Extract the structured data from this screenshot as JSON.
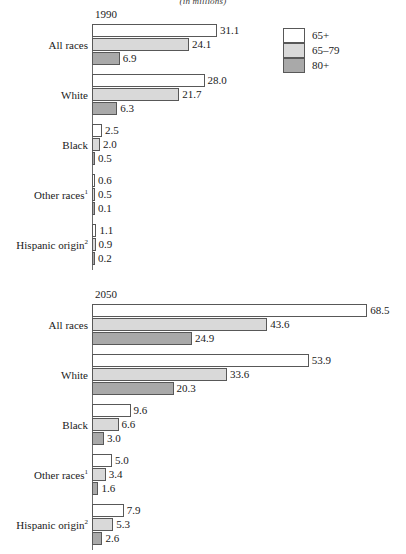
{
  "chart_data": {
    "type": "bar",
    "orientation": "horizontal",
    "title": "",
    "subtitle": "(in millions)",
    "xlabel": "",
    "ylabel": "",
    "grid": false,
    "legend_position": "top-right",
    "xlim": [
      0,
      68.5
    ],
    "categories": [
      "All races",
      "White",
      "Black",
      "Other races",
      "Hispanic origin"
    ],
    "category_footnotes": [
      "",
      "",
      "",
      "1",
      "2"
    ],
    "series": [
      {
        "name": "65+",
        "color": "#ffffff"
      },
      {
        "name": "65–79",
        "color": "#d9d9d9"
      },
      {
        "name": "80+",
        "color": "#a9a9a9"
      }
    ],
    "panels": [
      {
        "label": "1990",
        "groups": [
          {
            "category": "All races",
            "footnote": "",
            "values": [
              31.1,
              24.1,
              6.9
            ],
            "labels": [
              "31.1",
              "24.1",
              "6.9"
            ]
          },
          {
            "category": "White",
            "footnote": "",
            "values": [
              28.0,
              21.7,
              6.3
            ],
            "labels": [
              "28.0",
              "21.7",
              "6.3"
            ]
          },
          {
            "category": "Black",
            "footnote": "",
            "values": [
              2.5,
              2.0,
              0.5
            ],
            "labels": [
              "2.5",
              "2.0",
              "0.5"
            ]
          },
          {
            "category": "Other races",
            "footnote": "1",
            "values": [
              0.6,
              0.5,
              0.1
            ],
            "labels": [
              "0.6",
              "0.5",
              "0.1"
            ]
          },
          {
            "category": "Hispanic origin",
            "footnote": "2",
            "values": [
              1.1,
              0.9,
              0.2
            ],
            "labels": [
              "1.1",
              "0.9",
              "0.2"
            ]
          }
        ]
      },
      {
        "label": "2050",
        "groups": [
          {
            "category": "All races",
            "footnote": "",
            "values": [
              68.5,
              43.6,
              24.9
            ],
            "labels": [
              "68.5",
              "43.6",
              "24.9"
            ]
          },
          {
            "category": "White",
            "footnote": "",
            "values": [
              53.9,
              33.6,
              20.3
            ],
            "labels": [
              "53.9",
              "33.6",
              "20.3"
            ]
          },
          {
            "category": "Black",
            "footnote": "",
            "values": [
              9.6,
              6.6,
              3.0
            ],
            "labels": [
              "9.6",
              "6.6",
              "3.0"
            ]
          },
          {
            "category": "Other races",
            "footnote": "1",
            "values": [
              5.0,
              3.4,
              1.6
            ],
            "labels": [
              "5.0",
              "3.4",
              "1.6"
            ]
          },
          {
            "category": "Hispanic origin",
            "footnote": "2",
            "values": [
              7.9,
              5.3,
              2.6
            ],
            "labels": [
              "7.9",
              "5.3",
              "2.6"
            ]
          }
        ]
      }
    ]
  },
  "subtitle": "(in millions)",
  "legend": {
    "items": [
      {
        "label": "65+",
        "swatch": "c65plus"
      },
      {
        "label": "65–79",
        "swatch": "c6579"
      },
      {
        "label": "80+",
        "swatch": "c80plus"
      }
    ]
  },
  "panel_labels": {
    "first": "1990",
    "second": "2050"
  }
}
